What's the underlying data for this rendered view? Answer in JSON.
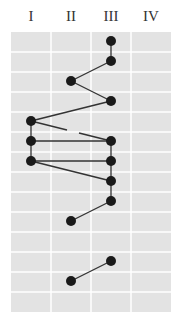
{
  "chart_data": {
    "type": "scatter",
    "title": "",
    "xlabel": "",
    "ylabel": "",
    "categories": [
      "I",
      "II",
      "III",
      "IV"
    ],
    "rows": 14,
    "grid": true,
    "colors": {
      "background": "#e3e3e3",
      "grid": "#ffffff",
      "point": "#1a1a1a",
      "line": "#333333"
    },
    "points": [
      {
        "id": "p1",
        "row": 1,
        "col": "III"
      },
      {
        "id": "p2",
        "row": 2,
        "col": "III"
      },
      {
        "id": "p3",
        "row": 3,
        "col": "II"
      },
      {
        "id": "p4",
        "row": 4,
        "col": "III"
      },
      {
        "id": "p5",
        "row": 5,
        "col": "I"
      },
      {
        "id": "p6",
        "row": 6,
        "col": "I"
      },
      {
        "id": "p7",
        "row": 6,
        "col": "III"
      },
      {
        "id": "p8",
        "row": 7,
        "col": "I"
      },
      {
        "id": "p9",
        "row": 7,
        "col": "III"
      },
      {
        "id": "p10",
        "row": 8,
        "col": "III"
      },
      {
        "id": "p11",
        "row": 9,
        "col": "III"
      },
      {
        "id": "p12",
        "row": 10,
        "col": "II"
      },
      {
        "id": "p13",
        "row": 12,
        "col": "III"
      },
      {
        "id": "p14",
        "row": 13,
        "col": "II"
      }
    ],
    "edges": [
      {
        "from": "p1",
        "to": "p2"
      },
      {
        "from": "p2",
        "to": "p3"
      },
      {
        "from": "p3",
        "to": "p4"
      },
      {
        "from": "p4",
        "to": "p5"
      },
      {
        "from": "p5",
        "to": "p7",
        "style": "broken"
      },
      {
        "from": "p5",
        "to": "p6"
      },
      {
        "from": "p6",
        "to": "p7"
      },
      {
        "from": "p6",
        "to": "p8"
      },
      {
        "from": "p8",
        "to": "p9"
      },
      {
        "from": "p8",
        "to": "p10"
      },
      {
        "from": "p7",
        "to": "p9"
      },
      {
        "from": "p9",
        "to": "p10"
      },
      {
        "from": "p10",
        "to": "p11"
      },
      {
        "from": "p11",
        "to": "p12"
      },
      {
        "from": "p13",
        "to": "p14"
      }
    ]
  }
}
